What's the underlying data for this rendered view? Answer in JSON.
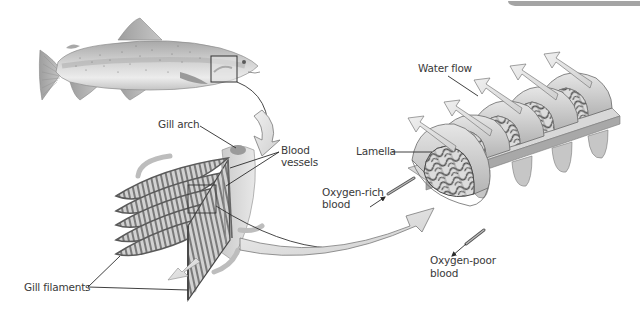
{
  "diagram": {
    "top_bar_color": "#9a9a9a",
    "colors": {
      "fish_body": "#d8d8d8",
      "fish_dark": "#9c9c9c",
      "fin": "#b8b8b8",
      "arrow_fill": "#e0e0e0",
      "arrow_stroke": "#7a7a7a",
      "filament_dark": "#6e6e6e",
      "filament_light": "#c8c8c8",
      "lamella_base": "#d4d4d4",
      "vessel_net": "#555555",
      "label_text": "#3a3a3a"
    },
    "labels": {
      "gill_arch": "Gill arch",
      "blood_vessels_line1": "Blood",
      "blood_vessels_line2": "vessels",
      "gill_filaments": "Gill filaments",
      "water_flow": "Water flow",
      "lamella": "Lamella",
      "oxygen_rich_line1": "Oxygen-rich",
      "oxygen_rich_line2": "blood",
      "oxygen_poor_line1": "Oxygen-poor",
      "oxygen_poor_line2": "blood"
    },
    "panels": [
      {
        "name": "whole-fish",
        "description": "Trout with highlighted gill region"
      },
      {
        "name": "gill-arch-detail",
        "description": "Gill arch with filaments and blood vessels"
      },
      {
        "name": "lamellae-detail",
        "description": "Lamellae with blood vessel network and water flow arrows"
      }
    ]
  }
}
